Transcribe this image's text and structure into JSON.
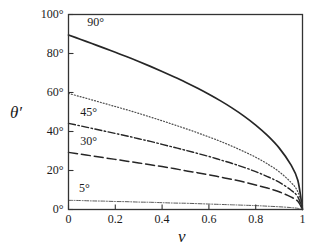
{
  "chart_data": {
    "type": "line",
    "title": "",
    "xlabel": "v",
    "ylabel": "θ′",
    "xlim": [
      0,
      1
    ],
    "ylim": [
      0,
      100
    ],
    "grid": false,
    "legend": "inline-curve-labels",
    "xticks": [
      "0",
      "0.2",
      "0.4",
      "0.6",
      "0.8",
      "1"
    ],
    "xtick_values": [
      0,
      0.2,
      0.4,
      0.6,
      0.8,
      1
    ],
    "yticks": [
      "0°",
      "20°",
      "40°",
      "60°",
      "80°",
      "100°"
    ],
    "ytick_values": [
      0,
      20,
      40,
      60,
      80,
      100
    ],
    "x": [
      0,
      0.05,
      0.1,
      0.15,
      0.2,
      0.25,
      0.3,
      0.35,
      0.4,
      0.45,
      0.5,
      0.55,
      0.6,
      0.65,
      0.7,
      0.75,
      0.8,
      0.85,
      0.9,
      0.95,
      0.98,
      1
    ],
    "series": [
      {
        "name": "90°",
        "label": "90°",
        "style": "solid",
        "color": "#262626",
        "width": 1.7,
        "values": [
          89.5,
          87.3,
          85.1,
          82.9,
          80.6,
          78.3,
          75.9,
          73.4,
          70.8,
          68.1,
          65.3,
          62.3,
          59.1,
          55.7,
          52.0,
          47.9,
          43.3,
          38.0,
          31.6,
          23.0,
          15.0,
          0
        ]
      },
      {
        "name": "60°",
        "label": "",
        "style": "dotted",
        "color": "#4d4d4d",
        "width": 1.2,
        "values": [
          59.5,
          57.9,
          56.2,
          54.5,
          52.8,
          51.1,
          49.3,
          47.4,
          45.5,
          43.5,
          41.5,
          39.4,
          37.2,
          34.9,
          32.4,
          29.7,
          26.8,
          23.4,
          19.4,
          14.0,
          9.1,
          0
        ]
      },
      {
        "name": "45°",
        "label": "45°",
        "style": "dashdot",
        "color": "#262626",
        "width": 1.4,
        "values": [
          44.2,
          42.9,
          41.6,
          40.3,
          39.0,
          37.7,
          36.3,
          34.9,
          33.4,
          31.9,
          30.4,
          28.8,
          27.2,
          25.4,
          23.6,
          21.6,
          19.4,
          16.9,
          14.0,
          10.0,
          6.5,
          0
        ]
      },
      {
        "name": "30°",
        "label": "30°",
        "style": "longdash",
        "color": "#262626",
        "width": 1.5,
        "values": [
          29.3,
          28.4,
          27.5,
          26.6,
          25.7,
          24.8,
          23.9,
          22.9,
          22.0,
          21.0,
          19.9,
          18.9,
          17.8,
          16.6,
          15.4,
          14.1,
          12.6,
          11.0,
          9.1,
          6.5,
          4.2,
          0
        ]
      },
      {
        "name": "5°",
        "label": "5°",
        "style": "finedashdot",
        "color": "#595959",
        "width": 1.0,
        "values": [
          4.7,
          4.6,
          4.4,
          4.3,
          4.1,
          4.0,
          3.8,
          3.7,
          3.5,
          3.3,
          3.2,
          3.0,
          2.8,
          2.6,
          2.4,
          2.2,
          2.0,
          1.7,
          1.4,
          1.0,
          0.6,
          0
        ]
      }
    ],
    "curve_labels": [
      {
        "text": "90°",
        "x": 0.08,
        "y": 96
      },
      {
        "text": "45°",
        "x": 0.05,
        "y": 50
      },
      {
        "text": "30°",
        "x": 0.05,
        "y": 35
      },
      {
        "text": "5°",
        "x": 0.045,
        "y": 11
      }
    ],
    "frame_color": "#333333"
  }
}
